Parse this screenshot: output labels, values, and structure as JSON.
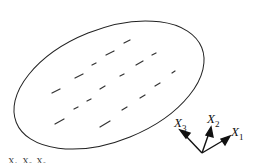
{
  "figure": {
    "axes": [
      {
        "label": "X",
        "subscript": "1"
      },
      {
        "label": "X",
        "subscript": "2"
      },
      {
        "label": "X",
        "subscript": "3"
      }
    ],
    "colors": {
      "stroke": "#222222",
      "background": "#ffffff"
    },
    "caption_partial": "X₁, X₂, X₃ ..."
  }
}
